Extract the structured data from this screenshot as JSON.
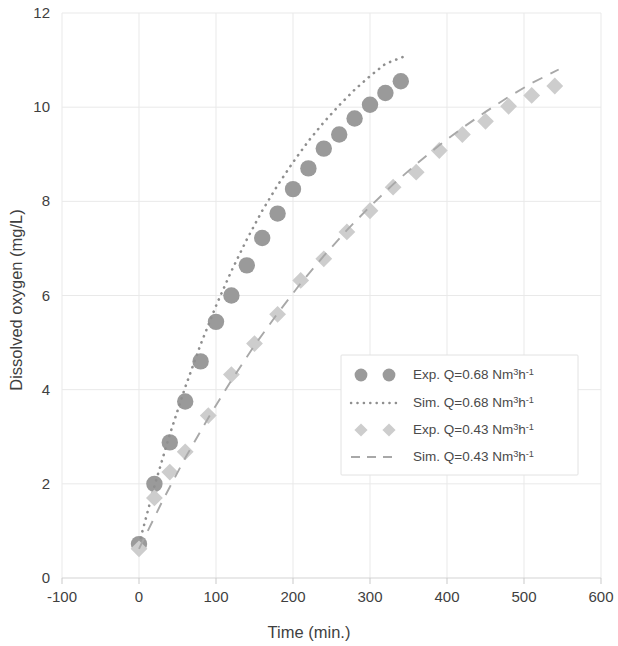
{
  "chart_data": {
    "type": "scatter",
    "title": "",
    "xlabel": "Time (min.)",
    "ylabel": "Dissolved oxygen (mg/L)",
    "xlim": [
      -100,
      600
    ],
    "ylim": [
      0,
      12
    ],
    "xticks": [
      -100,
      0,
      100,
      200,
      300,
      400,
      500,
      600
    ],
    "yticks": [
      0,
      2,
      4,
      6,
      8,
      10,
      12
    ],
    "grid": true,
    "legend_position": "center-right",
    "series": [
      {
        "name": "Exp. Q=0.68 Nm3h-1",
        "label_main": "Exp. Q=0.68 Nm",
        "label_sup1": "3",
        "label_mid": "h",
        "label_sup2": "-1",
        "marker": "circle",
        "color": "#9a9a9a",
        "style": "markers",
        "x": [
          0,
          20,
          40,
          60,
          80,
          100,
          120,
          140,
          160,
          180,
          200,
          220,
          240,
          260,
          280,
          300,
          320,
          340
        ],
        "y": [
          0.72,
          2.0,
          2.88,
          3.75,
          4.6,
          5.44,
          6.0,
          6.64,
          7.22,
          7.74,
          8.26,
          8.7,
          9.12,
          9.42,
          9.76,
          10.05,
          10.3,
          10.55
        ]
      },
      {
        "name": "Sim. Q=0.68 Nm3h-1",
        "label_main": "Sim. Q=0.68 Nm",
        "label_sup1": "3",
        "label_mid": "h",
        "label_sup2": "-1",
        "marker": "none",
        "color": "#8f8f8f",
        "style": "dotted",
        "x": [
          0,
          20,
          40,
          60,
          80,
          100,
          120,
          140,
          160,
          180,
          200,
          220,
          240,
          260,
          280,
          300,
          320,
          340,
          345
        ],
        "y": [
          0.72,
          1.95,
          3.05,
          4.05,
          4.96,
          5.78,
          6.52,
          7.19,
          7.8,
          8.34,
          8.83,
          9.28,
          9.68,
          10.04,
          10.37,
          10.66,
          10.92,
          11.05,
          11.08
        ]
      },
      {
        "name": "Exp. Q=0.43 Nm3h-1",
        "label_main": "Exp. Q=0.43 Nm",
        "label_sup1": "3",
        "label_mid": "h",
        "label_sup2": "-1",
        "marker": "diamond",
        "color": "#cdcdcd",
        "style": "markers",
        "x": [
          0,
          20,
          40,
          60,
          90,
          120,
          150,
          180,
          210,
          240,
          270,
          300,
          330,
          360,
          390,
          420,
          450,
          480,
          510,
          540
        ],
        "y": [
          0.62,
          1.7,
          2.25,
          2.68,
          3.45,
          4.32,
          4.98,
          5.6,
          6.32,
          6.78,
          7.35,
          7.8,
          8.3,
          8.62,
          9.08,
          9.42,
          9.7,
          10.02,
          10.25,
          10.45
        ]
      },
      {
        "name": "Sim. Q=0.43 Nm3h-1",
        "label_main": "Sim. Q=0.43 Nm",
        "label_sup1": "3",
        "label_mid": "h",
        "label_sup2": "-1",
        "marker": "none",
        "color": "#a8a8a8",
        "style": "dashed",
        "x": [
          0,
          30,
          60,
          90,
          120,
          150,
          180,
          210,
          240,
          270,
          300,
          330,
          360,
          390,
          420,
          450,
          480,
          510,
          545
        ],
        "y": [
          0.62,
          1.62,
          2.55,
          3.4,
          4.2,
          4.94,
          5.62,
          6.26,
          6.84,
          7.39,
          7.89,
          8.36,
          8.79,
          9.19,
          9.56,
          9.9,
          10.22,
          10.51,
          10.8
        ]
      }
    ]
  },
  "legend": {
    "entries": [
      {
        "kind": "marker-circle",
        "text": "Exp. Q=0.68 Nm3h-1"
      },
      {
        "kind": "line-dotted",
        "text": "Sim. Q=0.68 Nm3h-1"
      },
      {
        "kind": "marker-diamond",
        "text": "Exp. Q=0.43 Nm3h-1"
      },
      {
        "kind": "line-dashed",
        "text": "Sim. Q=0.43 Nm3h-1"
      }
    ]
  },
  "colors": {
    "series_dark": "#9a9a9a",
    "series_light": "#cdcdcd",
    "grid": "#e9e9e9",
    "axis": "#d3d3d3",
    "text": "#3f3f3f"
  }
}
